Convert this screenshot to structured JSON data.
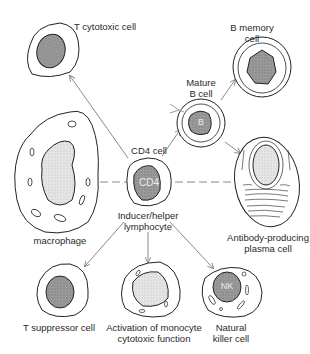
{
  "colors": {
    "line": "#222222",
    "arrow": "#8a8a8a",
    "nucleus": "#8c8c8c",
    "nucleus_light": "#d8d8d8",
    "background": "#ffffff"
  },
  "cells": {
    "t_cytotoxic": {
      "label": "T cytotoxic cell"
    },
    "b_memory": {
      "label_line1": "B memory",
      "label_line2": "cell"
    },
    "mature_b": {
      "label_line1": "Mature",
      "label_line2": "B cell",
      "nucleus_text": "B"
    },
    "macrophage": {
      "label": "macrophage"
    },
    "cd4": {
      "label": "CD4 cell",
      "nucleus_text": "CD4",
      "label2_line1": "Inducer/helper",
      "label2_line2": "lymphocyte"
    },
    "plasma": {
      "label_line1": "Antibody-producing",
      "label_line2": "plasma cell"
    },
    "t_suppressor": {
      "label": "T suppressor cell"
    },
    "monocyte": {
      "label_line1": "Activation of monocyte",
      "label_line2": "cytotoxic function"
    },
    "nk": {
      "label_line1": "Natural",
      "label_line2": "killer cell",
      "nucleus_text": "NK"
    }
  },
  "connections": [
    {
      "from": "cd4",
      "to": "t_cytotoxic",
      "style": "arrow"
    },
    {
      "from": "cd4",
      "to": "mature_b",
      "style": "arrow"
    },
    {
      "from": "mature_b",
      "to": "b_memory",
      "style": "arrow"
    },
    {
      "from": "mature_b",
      "to": "plasma",
      "style": "arrow"
    },
    {
      "from": "macrophage",
      "to": "cd4",
      "style": "dashed"
    },
    {
      "from": "cd4",
      "to": "plasma",
      "style": "dashed"
    },
    {
      "from": "cd4",
      "to": "t_suppressor",
      "style": "arrow"
    },
    {
      "from": "cd4",
      "to": "monocyte",
      "style": "arrow"
    },
    {
      "from": "cd4",
      "to": "nk",
      "style": "arrow"
    }
  ]
}
